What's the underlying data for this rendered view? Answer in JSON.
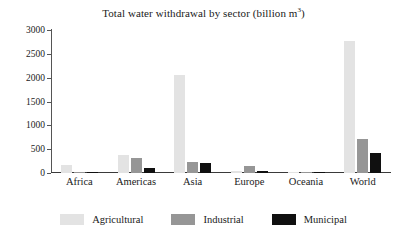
{
  "chart_data": {
    "type": "bar",
    "title_main": "Total water withdrawal by sector (billion m",
    "title_sup": "3",
    "title_tail": ")",
    "xlabel": "",
    "ylabel": "",
    "ylim": [
      0,
      3000
    ],
    "yticks": [
      0,
      500,
      1000,
      1500,
      2000,
      2500,
      3000
    ],
    "ytick_labels": [
      "0",
      "500",
      "1000",
      "1500",
      "2000",
      "2500",
      "3000"
    ],
    "grid": false,
    "legend_position": "bottom",
    "categories": [
      "Africa",
      "Americas",
      "Asia",
      "Europe",
      "Oceania",
      "World"
    ],
    "series": [
      {
        "name": "Agricultural",
        "color": "#e3e3e3",
        "values": [
          170,
          385,
          2050,
          50,
          15,
          2770
        ]
      },
      {
        "name": "Industrial",
        "color": "#969696",
        "values": [
          10,
          305,
          225,
          155,
          5,
          720
        ]
      },
      {
        "name": "Municipal",
        "color": "#101010",
        "values": [
          30,
          105,
          215,
          45,
          5,
          425
        ]
      }
    ]
  },
  "legend": {
    "items": [
      {
        "label": "Agricultural",
        "key": "agricultural"
      },
      {
        "label": "Industrial",
        "key": "industrial"
      },
      {
        "label": "Municipal",
        "key": "municipal"
      }
    ]
  },
  "colors": {
    "agricultural": "#e3e3e3",
    "industrial": "#969696",
    "municipal": "#101010",
    "axis": "#3a3a3a",
    "text": "#1a1a1a",
    "background": "#ffffff"
  }
}
